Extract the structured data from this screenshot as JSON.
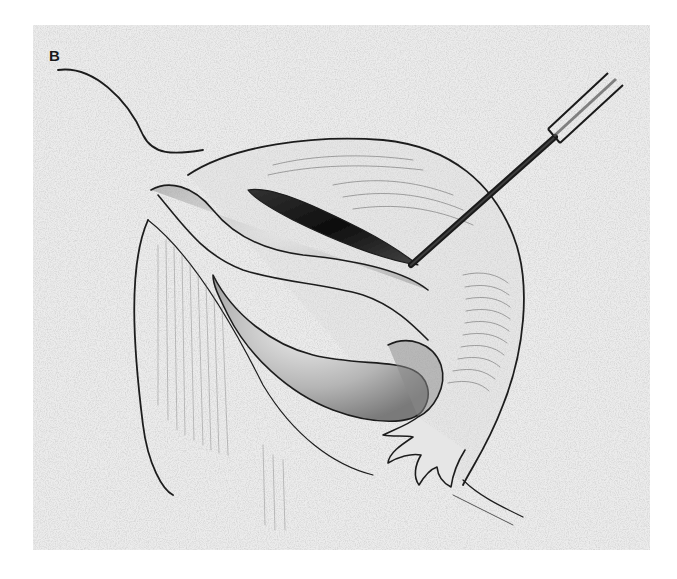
{
  "figure": {
    "panel_label": "B",
    "colors": {
      "paper": "#e9e9e9",
      "stroke": "#1e1e1e",
      "shade": "#6a6a6a",
      "background": "#ffffff"
    }
  }
}
